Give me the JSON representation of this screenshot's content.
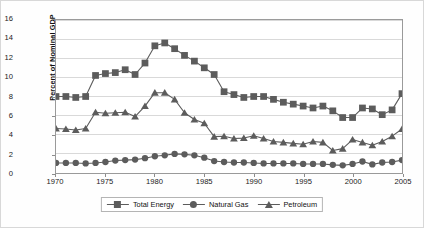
{
  "chart_data": {
    "type": "line",
    "title": "",
    "xlabel": "",
    "ylabel": "Percent of Nominal GDP",
    "xlim": [
      1970,
      2005
    ],
    "ylim": [
      0,
      16
    ],
    "ytick_step": 2,
    "grid": "horizontal",
    "legend_position": "bottom",
    "yticks": [
      "0",
      "2",
      "4",
      "6",
      "8",
      "10",
      "12",
      "14",
      "16"
    ],
    "xticks": [
      "1970",
      "1975",
      "1980",
      "1985",
      "1990",
      "1995",
      "2000",
      "2005"
    ],
    "x": [
      1970,
      1971,
      1972,
      1973,
      1974,
      1975,
      1976,
      1977,
      1978,
      1979,
      1980,
      1981,
      1982,
      1983,
      1984,
      1985,
      1986,
      1987,
      1988,
      1989,
      1990,
      1991,
      1992,
      1993,
      1994,
      1995,
      1996,
      1997,
      1998,
      1999,
      2000,
      2001,
      2002,
      2003,
      2004,
      2005
    ],
    "series": [
      {
        "name": "Total Energy",
        "marker": "square",
        "color": "#5c5c5c",
        "values": [
          8.0,
          8.0,
          7.9,
          8.0,
          10.2,
          10.4,
          10.5,
          10.8,
          10.3,
          11.5,
          13.3,
          13.6,
          13.0,
          12.3,
          11.7,
          11.0,
          10.3,
          8.5,
          8.2,
          7.9,
          8.0,
          8.0,
          7.7,
          7.4,
          7.2,
          7.0,
          6.8,
          7.0,
          6.5,
          5.8,
          5.8,
          6.8,
          6.7,
          6.1,
          6.6,
          8.3
        ]
      },
      {
        "name": "Natural Gas",
        "marker": "circle",
        "color": "#5c5c5c",
        "values": [
          1.05,
          1.05,
          1.05,
          1.0,
          1.05,
          1.15,
          1.3,
          1.35,
          1.4,
          1.55,
          1.75,
          1.85,
          2.0,
          1.95,
          1.85,
          1.6,
          1.25,
          1.15,
          1.1,
          1.1,
          1.05,
          1.0,
          1.0,
          1.0,
          1.0,
          0.95,
          0.95,
          0.95,
          0.85,
          0.8,
          0.95,
          1.2,
          0.9,
          1.1,
          1.15,
          1.35
        ]
      },
      {
        "name": "Petroleum",
        "marker": "triangle",
        "color": "#5c5c5c",
        "values": [
          4.65,
          4.6,
          4.5,
          4.65,
          6.35,
          6.25,
          6.3,
          6.35,
          5.9,
          7.0,
          8.4,
          8.4,
          7.7,
          6.3,
          5.6,
          5.2,
          3.8,
          3.85,
          3.6,
          3.65,
          3.9,
          3.6,
          3.3,
          3.2,
          3.1,
          3.0,
          3.3,
          3.2,
          2.35,
          2.55,
          3.5,
          3.2,
          2.9,
          3.3,
          3.85,
          4.6
        ]
      }
    ]
  },
  "legend": {
    "items": [
      {
        "label": "Total Energy",
        "marker": "square"
      },
      {
        "label": "Natural Gas",
        "marker": "circle"
      },
      {
        "label": "Petroleum",
        "marker": "triangle"
      }
    ]
  },
  "axes": {
    "y_title": "Percent of Nominal GDP"
  },
  "colors": {
    "series": "#5c5c5c",
    "grid": "#cfcfcf",
    "frame": "#9a9a9a",
    "text": "#1a1a1a"
  }
}
